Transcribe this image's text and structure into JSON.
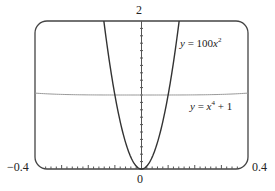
{
  "chart_data": {
    "type": "line",
    "title": "",
    "xlabel": "",
    "ylabel": "",
    "xlim": [
      -0.4,
      0.4
    ],
    "ylim": [
      0,
      2
    ],
    "grid": false,
    "tick_labels": {
      "x_left": "−0.4",
      "x_right": "0.4",
      "x_origin": "0",
      "y_top": "2"
    },
    "series": [
      {
        "name": "y = 100x^2",
        "expression": "100*x^2",
        "x": [
          -0.1414,
          -0.12,
          -0.1,
          -0.08,
          -0.06,
          -0.04,
          -0.02,
          0,
          0.02,
          0.04,
          0.06,
          0.08,
          0.1,
          0.12,
          0.1414
        ],
        "values": [
          2.0,
          1.44,
          1.0,
          0.64,
          0.36,
          0.16,
          0.04,
          0,
          0.04,
          0.16,
          0.36,
          0.64,
          1.0,
          1.44,
          2.0
        ],
        "color": "#333333"
      },
      {
        "name": "y = x^4 + 1",
        "expression": "x^4+1",
        "x": [
          -0.4,
          -0.2,
          0,
          0.2,
          0.4
        ],
        "values": [
          1.0256,
          1.0016,
          1.0,
          1.0016,
          1.0256
        ],
        "color": "#888888"
      }
    ],
    "annotations": [
      {
        "text": "y = 100x²",
        "near_series": "y = 100x^2"
      },
      {
        "text": "y = x⁴ + 1",
        "near_series": "y = x^4 + 1"
      }
    ]
  },
  "labels": {
    "y_top": "2",
    "x_left": "−0.4",
    "x_right": "0.4",
    "x_origin": "0",
    "eq1_y": "y",
    "eq1_rest": " = 100",
    "eq1_x": "x",
    "eq1_sup": "2",
    "eq2_y": "y",
    "eq2_mid": " = ",
    "eq2_x": "x",
    "eq2_sup": "4",
    "eq2_rest": " + 1"
  }
}
